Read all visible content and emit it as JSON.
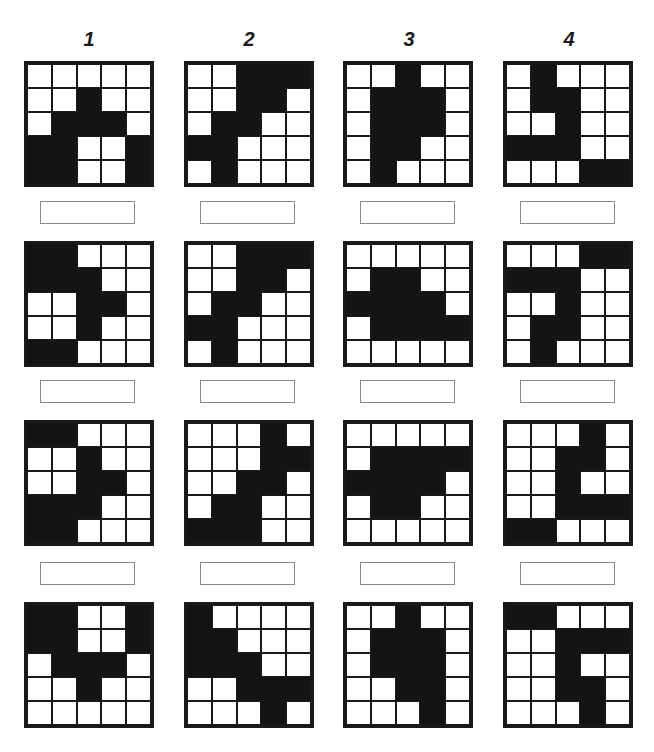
{
  "columns": [
    {
      "label": "1",
      "x": 69
    },
    {
      "label": "2",
      "x": 229
    },
    {
      "label": "3",
      "x": 389
    },
    {
      "label": "4",
      "x": 549
    }
  ],
  "layout": {
    "grid_x": [
      24,
      184,
      343,
      503
    ],
    "grid_y": [
      61,
      241,
      420,
      602
    ],
    "answer_x": [
      40,
      200,
      360,
      520
    ],
    "answer_y": [
      201,
      380,
      562
    ]
  },
  "colors": {
    "fill": "#141414",
    "empty": "#ffffff",
    "line": "#1a1a1a",
    "answer_border": "#8a8a8a"
  },
  "grids": [
    [
      [
        [
          0,
          0,
          0,
          0,
          0
        ],
        [
          0,
          0,
          1,
          0,
          0
        ],
        [
          0,
          1,
          1,
          1,
          0
        ],
        [
          1,
          1,
          0,
          0,
          1
        ],
        [
          1,
          1,
          0,
          0,
          1
        ]
      ],
      [
        [
          0,
          0,
          1,
          1,
          1
        ],
        [
          0,
          0,
          1,
          1,
          0
        ],
        [
          0,
          1,
          1,
          0,
          0
        ],
        [
          1,
          1,
          0,
          0,
          0
        ],
        [
          0,
          1,
          0,
          0,
          0
        ]
      ],
      [
        [
          0,
          0,
          1,
          0,
          0
        ],
        [
          0,
          1,
          1,
          1,
          0
        ],
        [
          0,
          1,
          1,
          1,
          0
        ],
        [
          0,
          1,
          1,
          0,
          0
        ],
        [
          0,
          1,
          0,
          0,
          0
        ]
      ],
      [
        [
          0,
          1,
          0,
          0,
          0
        ],
        [
          0,
          1,
          1,
          0,
          0
        ],
        [
          0,
          0,
          1,
          0,
          0
        ],
        [
          1,
          1,
          1,
          0,
          0
        ],
        [
          0,
          0,
          0,
          1,
          1
        ]
      ]
    ],
    [
      [
        [
          1,
          1,
          0,
          0,
          0
        ],
        [
          1,
          1,
          1,
          0,
          0
        ],
        [
          0,
          0,
          1,
          1,
          0
        ],
        [
          0,
          0,
          1,
          0,
          0
        ],
        [
          1,
          1,
          0,
          0,
          0
        ]
      ],
      [
        [
          0,
          0,
          1,
          1,
          1
        ],
        [
          0,
          0,
          1,
          1,
          0
        ],
        [
          0,
          1,
          1,
          0,
          0
        ],
        [
          1,
          1,
          0,
          0,
          0
        ],
        [
          0,
          1,
          0,
          0,
          0
        ]
      ],
      [
        [
          0,
          0,
          0,
          0,
          0
        ],
        [
          0,
          1,
          1,
          0,
          0
        ],
        [
          1,
          1,
          1,
          1,
          0
        ],
        [
          0,
          1,
          1,
          1,
          1
        ],
        [
          0,
          0,
          0,
          0,
          0
        ]
      ],
      [
        [
          0,
          0,
          0,
          1,
          1
        ],
        [
          1,
          1,
          1,
          0,
          0
        ],
        [
          0,
          0,
          1,
          0,
          0
        ],
        [
          0,
          1,
          1,
          0,
          0
        ],
        [
          0,
          1,
          0,
          0,
          0
        ]
      ]
    ],
    [
      [
        [
          1,
          1,
          0,
          0,
          0
        ],
        [
          0,
          0,
          1,
          0,
          0
        ],
        [
          0,
          0,
          1,
          1,
          0
        ],
        [
          1,
          1,
          1,
          0,
          0
        ],
        [
          1,
          1,
          0,
          0,
          0
        ]
      ],
      [
        [
          0,
          0,
          0,
          1,
          0
        ],
        [
          0,
          0,
          0,
          1,
          1
        ],
        [
          0,
          0,
          1,
          1,
          0
        ],
        [
          0,
          1,
          1,
          0,
          0
        ],
        [
          1,
          1,
          1,
          0,
          0
        ]
      ],
      [
        [
          0,
          0,
          0,
          0,
          0
        ],
        [
          0,
          1,
          1,
          1,
          1
        ],
        [
          1,
          1,
          1,
          1,
          0
        ],
        [
          0,
          1,
          1,
          0,
          0
        ],
        [
          0,
          0,
          0,
          0,
          0
        ]
      ],
      [
        [
          0,
          0,
          0,
          1,
          0
        ],
        [
          0,
          0,
          1,
          1,
          0
        ],
        [
          0,
          0,
          1,
          0,
          0
        ],
        [
          0,
          0,
          1,
          1,
          1
        ],
        [
          1,
          1,
          0,
          0,
          0
        ]
      ]
    ],
    [
      [
        [
          1,
          1,
          0,
          0,
          1
        ],
        [
          1,
          1,
          0,
          0,
          1
        ],
        [
          0,
          1,
          1,
          1,
          0
        ],
        [
          0,
          0,
          1,
          0,
          0
        ],
        [
          0,
          0,
          0,
          0,
          0
        ]
      ],
      [
        [
          1,
          0,
          0,
          0,
          0
        ],
        [
          1,
          1,
          0,
          0,
          0
        ],
        [
          1,
          1,
          1,
          0,
          0
        ],
        [
          0,
          0,
          1,
          1,
          1
        ],
        [
          0,
          0,
          0,
          1,
          0
        ]
      ],
      [
        [
          0,
          0,
          1,
          0,
          0
        ],
        [
          0,
          1,
          1,
          1,
          0
        ],
        [
          0,
          1,
          1,
          1,
          0
        ],
        [
          0,
          0,
          1,
          1,
          0
        ],
        [
          0,
          0,
          0,
          1,
          0
        ]
      ],
      [
        [
          1,
          1,
          0,
          0,
          0
        ],
        [
          0,
          0,
          1,
          1,
          1
        ],
        [
          0,
          0,
          1,
          0,
          0
        ],
        [
          0,
          0,
          1,
          1,
          0
        ],
        [
          0,
          0,
          0,
          1,
          0
        ]
      ]
    ]
  ],
  "answers": [
    [
      "",
      "",
      "",
      ""
    ],
    [
      "",
      "",
      "",
      ""
    ],
    [
      "",
      "",
      "",
      ""
    ]
  ]
}
